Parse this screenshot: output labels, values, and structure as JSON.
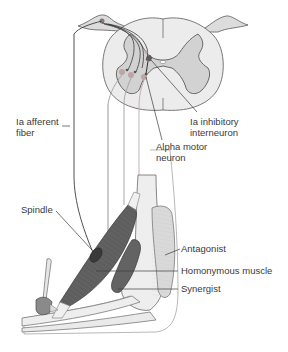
{
  "diagram": {
    "type": "anatomical-illustration",
    "labels": {
      "ia_afferent": [
        "Ia afferent",
        "fiber"
      ],
      "ia_inhibitory": [
        "Ia inhibitory",
        "interneuron"
      ],
      "alpha_motor": [
        "Alpha motor",
        "neuron"
      ],
      "spindle": "Spindle",
      "antagonist": "Antagonist",
      "homonymous": "Homonymous muscle",
      "synergist": "Synergist"
    },
    "colors": {
      "white_matter": "#ececec",
      "gray_matter": "#d2d2d2",
      "outline": "#5a5a5a",
      "muscle_dark": "#5e5e5e",
      "muscle_light": "#d9d9d9",
      "bone": "#eeeeee",
      "neuron_pink": "#bfa4a4",
      "line": "#3c3c3c"
    }
  }
}
